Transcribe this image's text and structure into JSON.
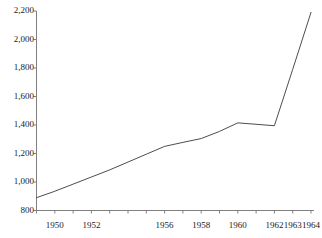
{
  "chart_data": {
    "type": "line",
    "title": "",
    "subtitle": "",
    "xlabel": "",
    "ylabel": "",
    "xlim": [
      1949,
      1964
    ],
    "ylim": [
      800,
      2200
    ],
    "grid": false,
    "legend": null,
    "y_ticks": [
      800,
      1000,
      1200,
      1400,
      1600,
      1800,
      2000,
      2200
    ],
    "y_tick_labels": [
      "800",
      "1,000",
      "1,200",
      "1,400",
      "1,600",
      "1,800",
      "2,000",
      "2,200"
    ],
    "x_ticks": [
      1949,
      1950,
      1951,
      1952,
      1953,
      1954,
      1955,
      1956,
      1957,
      1958,
      1959,
      1960,
      1961,
      1962,
      1963,
      1964
    ],
    "x_tick_labels": [
      {
        "year": 1950,
        "label": "1950"
      },
      {
        "year": 1952,
        "label": "1952"
      },
      {
        "year": 1956,
        "label": "1956"
      },
      {
        "year": 1958,
        "label": "1958"
      },
      {
        "year": 1960,
        "label": "1960"
      },
      {
        "year": 1962,
        "label": "1962"
      },
      {
        "year": 1963,
        "label": "1963"
      },
      {
        "year": 1964,
        "label": "1964"
      }
    ],
    "series": [
      {
        "name": "series-1",
        "color": "#4d4d4d",
        "x": [
          1949,
          1950,
          1951,
          1952,
          1953,
          1954,
          1955,
          1956,
          1957,
          1958,
          1959,
          1960,
          1961,
          1962,
          1963,
          1964
        ],
        "values": [
          890,
          935,
          985,
          1035,
          1085,
          1140,
          1195,
          1250,
          1278,
          1305,
          1355,
          1415,
          1405,
          1395,
          1790,
          2190
        ]
      }
    ],
    "colors": {
      "line": "#4d4d4d",
      "axis": "#808080",
      "text": "#1a1a1a",
      "background": "#ffffff"
    }
  }
}
